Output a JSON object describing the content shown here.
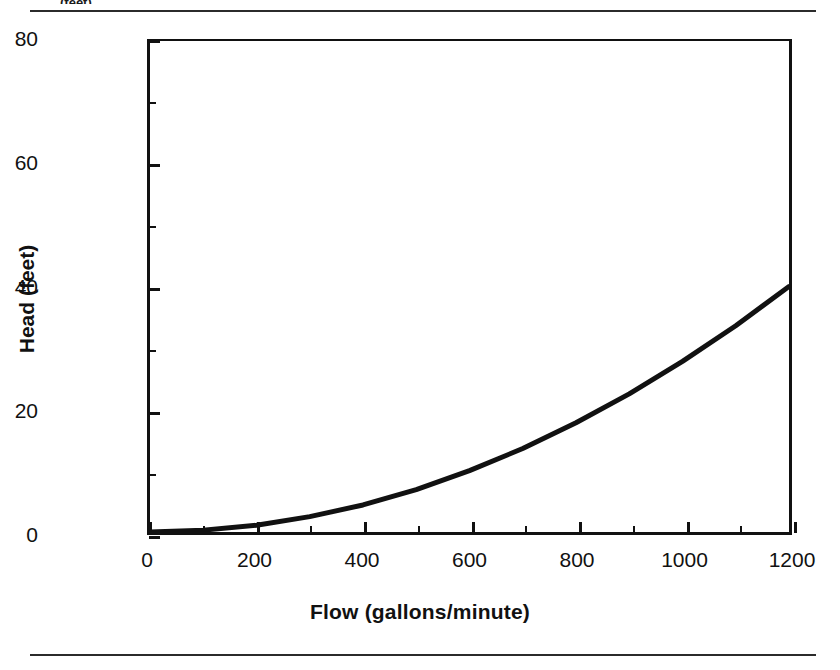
{
  "page": {
    "clipped_header_text": "(feet)"
  },
  "chart_data": {
    "type": "line",
    "title": "",
    "xlabel": "Flow (gallons/minute)",
    "ylabel": "Head (feet)",
    "xlim": [
      0,
      1200
    ],
    "ylim": [
      0,
      80
    ],
    "xticks": [
      0,
      200,
      400,
      600,
      800,
      1000,
      1200
    ],
    "yticks": [
      0,
      20,
      40,
      60,
      80
    ],
    "xtick_labels": [
      "0",
      "200",
      "400",
      "600",
      "800",
      "1000",
      "1200"
    ],
    "ytick_labels": [
      "0",
      "20",
      "40",
      "60",
      "80"
    ],
    "x_minor_interval": 100,
    "y_minor_interval": 10,
    "grid": false,
    "legend": null,
    "series": [
      {
        "name": "System head curve",
        "color": "#111111",
        "line_width": 5,
        "x": [
          0,
          100,
          200,
          300,
          400,
          500,
          600,
          700,
          800,
          900,
          1000,
          1100,
          1200
        ],
        "values": [
          0.0,
          0.3,
          1.1,
          2.5,
          4.4,
          6.9,
          10.0,
          13.6,
          17.8,
          22.5,
          27.8,
          33.6,
          40.0
        ]
      }
    ]
  }
}
